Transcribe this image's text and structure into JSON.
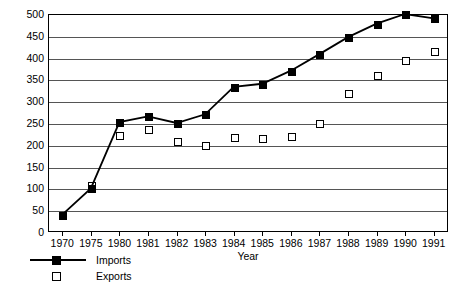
{
  "chart_data": {
    "type": "line",
    "title": "",
    "xlabel": "Year",
    "ylabel": "",
    "categories": [
      "1970",
      "1975",
      "1980",
      "1981",
      "1982",
      "1983",
      "1984",
      "1985",
      "1986",
      "1987",
      "1988",
      "1989",
      "1990",
      "1991"
    ],
    "series": [
      {
        "name": "Imports",
        "marker": "filled-square",
        "connected": true,
        "color": "#000000",
        "values": [
          40,
          100,
          252,
          265,
          250,
          270,
          333,
          340,
          370,
          408,
          447,
          478,
          500,
          490
        ]
      },
      {
        "name": "Exports",
        "marker": "open-square",
        "connected": false,
        "color": "#ffffff",
        "values": [
          40,
          108,
          222,
          237,
          208,
          200,
          218,
          215,
          220,
          250,
          318,
          360,
          395,
          415
        ]
      }
    ],
    "ylim": [
      0,
      500
    ],
    "ytick_labels": [
      "0",
      "50",
      "100",
      "150",
      "200",
      "250",
      "300",
      "350",
      "400",
      "450",
      "500"
    ],
    "ytick_values": [
      0,
      50,
      100,
      150,
      200,
      250,
      300,
      350,
      400,
      450,
      500
    ],
    "grid": "horizontal",
    "legend_position": "bottom-left",
    "legend_entries": [
      "Imports",
      "Exports"
    ]
  }
}
